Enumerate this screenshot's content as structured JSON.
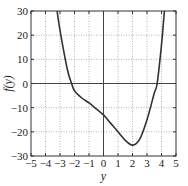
{
  "chart_data": {
    "type": "line",
    "title": "",
    "xlabel": "y",
    "ylabel": "f(y)",
    "xlim": [
      -5,
      5
    ],
    "ylim": [
      -30,
      30
    ],
    "xticks": [
      -5,
      -4,
      -3,
      -2,
      -1,
      0,
      1,
      2,
      3,
      4,
      5
    ],
    "yticks": [
      -30,
      -20,
      -10,
      0,
      10,
      20,
      30
    ],
    "xtick_labels": [
      "−5",
      "−4",
      "−3",
      "−2",
      "−1",
      "0",
      "1",
      "2",
      "3",
      "4",
      "5"
    ],
    "ytick_labels": [
      "−30",
      "−20",
      "−10",
      "0",
      "10",
      "20",
      "30"
    ],
    "grid": true,
    "grid_style": "dotted",
    "zero_lines": true,
    "legend": null,
    "series": [
      {
        "name": "f(y)",
        "color": "#333333",
        "x": [
          -3.2,
          -3.0,
          -2.5,
          -2.2,
          -2.0,
          -1.5,
          -1.0,
          -0.5,
          0.0,
          0.5,
          1.0,
          1.5,
          2.0,
          2.5,
          3.0,
          3.5,
          3.7,
          4.0,
          4.2
        ],
        "y": [
          30,
          22,
          6,
          0,
          -3,
          -6,
          -8,
          -10.5,
          -13,
          -16.5,
          -20,
          -23.5,
          -25.5,
          -23,
          -15,
          -4,
          0,
          16,
          30
        ]
      }
    ]
  }
}
